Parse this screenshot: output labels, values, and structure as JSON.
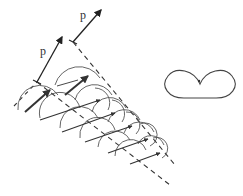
{
  "labels": {
    "p1": "p",
    "p2": "p"
  },
  "colors": {
    "line": "#333333",
    "arc": "#555555",
    "background": "#ffffff"
  },
  "figure": {
    "elements": [
      "momentum-arrow-1",
      "momentum-arrow-2",
      "dashed-boundary-upper",
      "dashed-boundary-lower",
      "wavelet-arcs",
      "propagation-arrows",
      "cardioid-pattern",
      "cardioid-center-dot"
    ]
  }
}
